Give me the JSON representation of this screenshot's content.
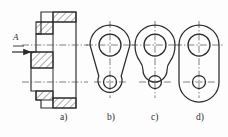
{
  "drawing": {
    "title": "Multi-view engineering drawing of a flanged link",
    "background_color": "#fdfdfd",
    "line_color": "#2b2b2b",
    "centerline_color": "#4a4a4a",
    "hatch_color": "#3a3a3a",
    "section_arrow_label": "A",
    "view_labels": [
      {
        "key": "a",
        "text": "a)",
        "x": 60,
        "y": 118,
        "description": "sectional view A-A of flanged body"
      },
      {
        "key": "b",
        "text": "b)",
        "x": 108,
        "y": 118,
        "description": "front view, tapered straight sides"
      },
      {
        "key": "c",
        "text": "c)",
        "x": 152,
        "y": 118,
        "description": "front view, concave waisted sides"
      },
      {
        "key": "d",
        "text": "d)",
        "x": 197,
        "y": 118,
        "description": "front view, straight parallel sides"
      }
    ],
    "centerlines": {
      "upper_y": 45,
      "lower_y": 82,
      "style": "dash-dot"
    },
    "section_view": {
      "name": "a",
      "label": "A",
      "arrow_direction": "right",
      "arrow_x_start": 12,
      "arrow_x_end": 33,
      "arrow_y": 52,
      "hatching": "45-degree diagonal section lines",
      "hub_left_edge": 31,
      "flange_right_edge": 76,
      "top_y": 12,
      "bottom_y": 108
    },
    "front_views": [
      {
        "key": "b",
        "cx_big": 110,
        "cy_big": 45,
        "r_big_outer": 20,
        "r_big_inner": 11,
        "cx_small": 110,
        "cy_small": 82,
        "r_small_outer": 12,
        "r_small_inner": 6.5,
        "side_profile": "tapered-straight"
      },
      {
        "key": "c",
        "cx_big": 155,
        "cy_big": 45,
        "r_big_outer": 20,
        "r_big_inner": 11,
        "cx_small": 155,
        "cy_small": 82,
        "r_small_outer": 12,
        "r_small_inner": 6.5,
        "side_profile": "concave-waist"
      },
      {
        "key": "d",
        "cx_big": 199,
        "cy_big": 45,
        "r_big_outer": 20,
        "r_big_inner": 11,
        "cx_small": 199,
        "cy_small": 82,
        "r_small_outer": 12,
        "r_small_inner": 6.5,
        "side_profile": "parallel-straight"
      }
    ]
  }
}
